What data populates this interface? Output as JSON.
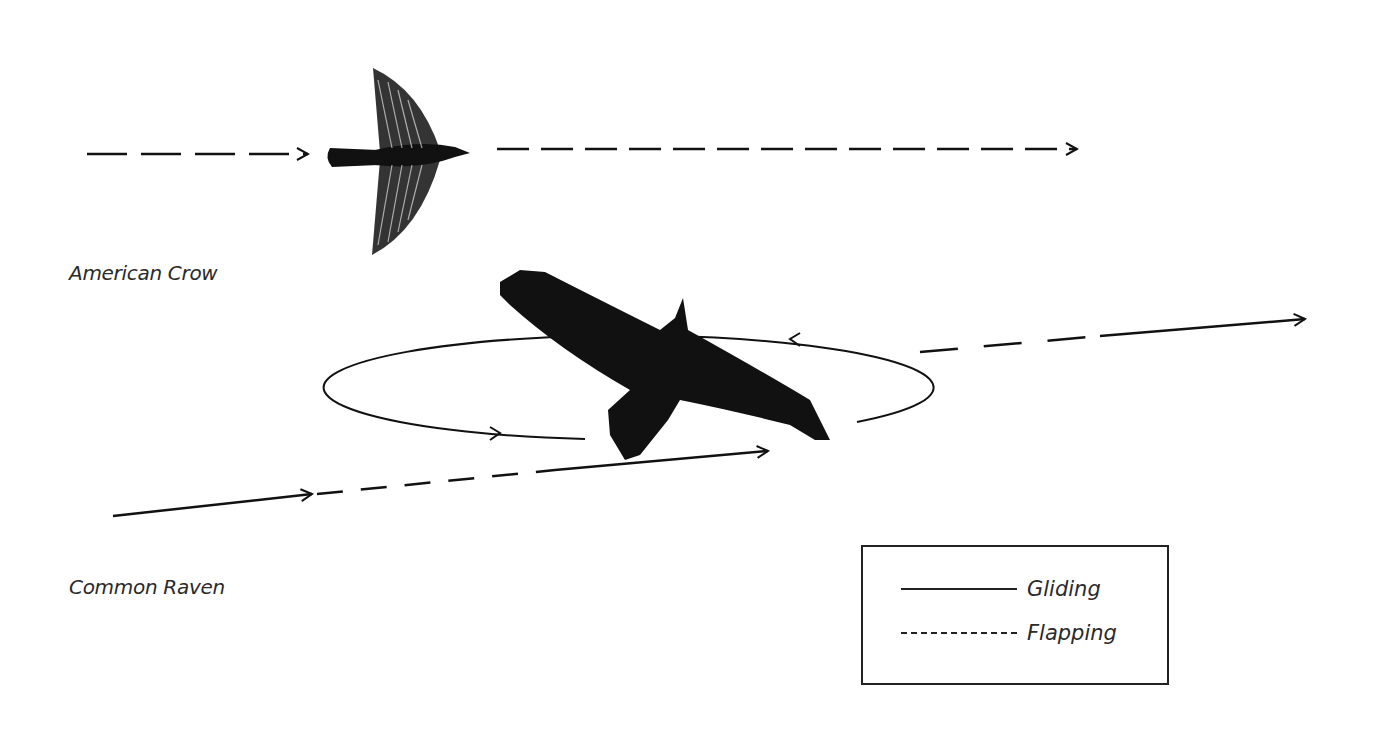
{
  "diagram": {
    "species": [
      {
        "label": "American Crow",
        "pattern": "flapping"
      },
      {
        "label": "Common Raven",
        "pattern": "gliding and flapping, circling soar"
      }
    ],
    "legend": {
      "items": [
        {
          "label": "Gliding",
          "style": "solid"
        },
        {
          "label": "Flapping",
          "style": "dashed"
        }
      ]
    },
    "colors": {
      "ink": "#111111",
      "text": "#2a2a2a",
      "background": "#ffffff"
    }
  }
}
